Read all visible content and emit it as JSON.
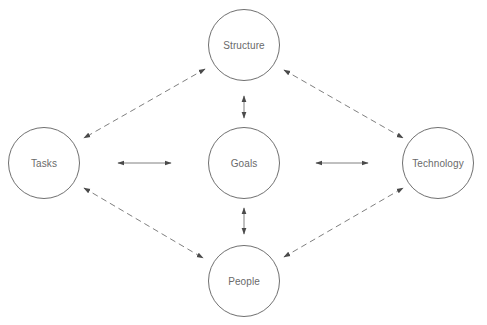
{
  "diagram": {
    "colors": {
      "node_stroke": "#707070",
      "label_text": "#6a6a6a",
      "arrow": "#4a4a4a",
      "background": "#ffffff"
    },
    "nodes": [
      {
        "id": "structure",
        "label": "Structure",
        "cx": 244,
        "cy": 45,
        "r": 36
      },
      {
        "id": "tasks",
        "label": "Tasks",
        "cx": 44,
        "cy": 163,
        "r": 36
      },
      {
        "id": "goals",
        "label": "Goals",
        "cx": 244,
        "cy": 163,
        "r": 36
      },
      {
        "id": "technology",
        "label": "Technology",
        "cx": 438,
        "cy": 163,
        "r": 36
      },
      {
        "id": "people",
        "label": "People",
        "cx": 244,
        "cy": 281,
        "r": 36
      }
    ],
    "edges": [
      {
        "from": "tasks",
        "to": "goals",
        "style": "solid",
        "direction": "both"
      },
      {
        "from": "goals",
        "to": "technology",
        "style": "solid",
        "direction": "both"
      },
      {
        "from": "structure",
        "to": "goals",
        "style": "solid",
        "direction": "both"
      },
      {
        "from": "goals",
        "to": "people",
        "style": "solid",
        "direction": "both"
      },
      {
        "from": "structure",
        "to": "tasks",
        "style": "dashed",
        "direction": "both"
      },
      {
        "from": "structure",
        "to": "technology",
        "style": "dashed",
        "direction": "both"
      },
      {
        "from": "tasks",
        "to": "people",
        "style": "dashed",
        "direction": "both"
      },
      {
        "from": "people",
        "to": "technology",
        "style": "dashed",
        "direction": "both"
      }
    ]
  }
}
